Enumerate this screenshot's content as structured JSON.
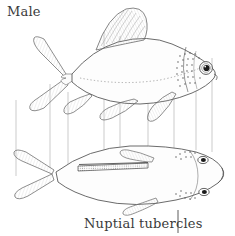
{
  "figure": {
    "kind": "scientific-illustration",
    "background_color": "#ffffff",
    "ink_color": "#3a3a3a",
    "line_color": "#555555",
    "projection_line_color": "#9a9a9a",
    "width": 235,
    "height": 236
  },
  "labels": {
    "male": "Male",
    "nuptial_tubercles": "Nuptial tubercles"
  },
  "annotations": {
    "leader_line": {
      "name": "nuptial-tubercles-leader",
      "x1": 178,
      "y1": 211,
      "x2": 178,
      "y2": 233
    }
  },
  "views": [
    {
      "name": "lateral-view",
      "description": "upper fish, side profile facing right",
      "parts": [
        "caudal-fin",
        "dorsal-fin",
        "anal-fin",
        "pelvic-fin",
        "pectoral-fin",
        "lateral-line",
        "eye",
        "operculum",
        "nuptial-tubercles"
      ]
    },
    {
      "name": "dorsal-view",
      "description": "lower fish, viewed from above facing right",
      "parts": [
        "caudal-fin",
        "dorsal-fin",
        "pectoral-fin-left",
        "pectoral-fin-right",
        "eye-left",
        "eye-right",
        "nuptial-tubercles"
      ]
    }
  ],
  "projection_lines": {
    "name": "view-projection-lines",
    "count": 9,
    "x_positions": [
      16,
      50,
      68,
      104,
      120,
      148,
      174,
      196,
      212
    ]
  }
}
